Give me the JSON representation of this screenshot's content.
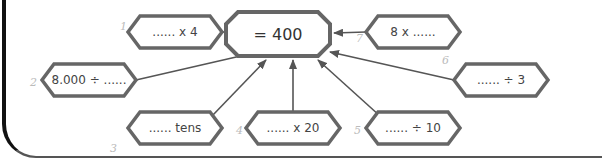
{
  "diagram": {
    "colors": {
      "stroke": "#666666",
      "arrow": "#555555",
      "text": "#444444",
      "frame": "#111111",
      "mark": "#bbbbbb"
    },
    "center": {
      "label": "= 400",
      "x": 226,
      "y": 12,
      "w": 104,
      "h": 44
    },
    "boxes": [
      {
        "id": "times-4",
        "label": "...... x 4",
        "x": 128,
        "y": 16,
        "w": 94,
        "h": 32,
        "tx": 270,
        "ty": 33
      },
      {
        "id": "8-times",
        "label": "8 x ......",
        "x": 366,
        "y": 16,
        "w": 94,
        "h": 32,
        "tx": 334,
        "ty": 33
      },
      {
        "id": "8000-div",
        "label": "8.000 ÷ ......",
        "x": 42,
        "y": 64,
        "w": 94,
        "h": 32,
        "tx": 258,
        "ty": 52
      },
      {
        "id": "div-3",
        "label": "...... ÷ 3",
        "x": 454,
        "y": 64,
        "w": 94,
        "h": 32,
        "tx": 330,
        "ty": 52
      },
      {
        "id": "tens",
        "label": "...... tens",
        "x": 128,
        "y": 112,
        "w": 94,
        "h": 32,
        "tx": 266,
        "ty": 60
      },
      {
        "id": "times-20",
        "label": "...... x 20",
        "x": 246,
        "y": 112,
        "w": 94,
        "h": 32,
        "tx": 293,
        "ty": 60
      },
      {
        "id": "div-10",
        "label": "...... ÷ 10",
        "x": 366,
        "y": 112,
        "w": 94,
        "h": 32,
        "tx": 318,
        "ty": 60
      }
    ],
    "marks": [
      {
        "text": "1",
        "x": 120,
        "y": 30
      },
      {
        "text": "7",
        "x": 356,
        "y": 42
      },
      {
        "text": "2",
        "x": 30,
        "y": 86
      },
      {
        "text": "6",
        "x": 442,
        "y": 64
      },
      {
        "text": "4",
        "x": 236,
        "y": 134
      },
      {
        "text": "5",
        "x": 354,
        "y": 134
      },
      {
        "text": "3",
        "x": 110,
        "y": 152
      }
    ]
  }
}
